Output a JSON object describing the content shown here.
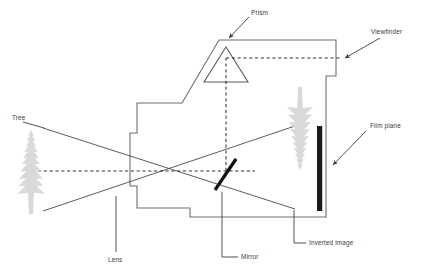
{
  "diagram": {
    "background_color": "#ffffff",
    "outline_color": "#6e6e6e",
    "ray_color": "#4a4a4a",
    "axis_color": "#333333",
    "label_color": "#3c3c3c",
    "tree_color": "#d8d8d8",
    "film_color": "#1a1a1a",
    "mirror_color": "#111111"
  },
  "labels": {
    "prism": "Prism",
    "viewfinder": "Viewfinder",
    "film_plane": "Film plane",
    "tree": "Tree",
    "lens": "Lens",
    "mirror": "Mirror",
    "inverted_image": "Inverted image"
  },
  "components": {
    "prism": {
      "name": "pentaprism",
      "shape": "triangle",
      "label": "Prism"
    },
    "viewfinder": {
      "name": "viewfinder-eyepiece",
      "label": "Viewfinder"
    },
    "film_plane": {
      "name": "film-plane-bar",
      "label": "Film plane"
    },
    "mirror": {
      "name": "reflex-mirror",
      "label": "Mirror",
      "angle_degrees": 45
    },
    "lens": {
      "name": "lens-barrel",
      "label": "Lens"
    },
    "subject_tree": {
      "name": "subject-tree",
      "label": "Tree",
      "orientation": "upright"
    },
    "inverted_image": {
      "name": "inverted-image-tree",
      "label": "Inverted image",
      "orientation": "inverted"
    }
  }
}
